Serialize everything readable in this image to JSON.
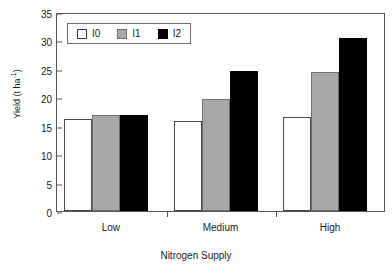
{
  "chart_data": {
    "type": "bar",
    "title": "",
    "xlabel": "Nitrogen Supply",
    "ylabel": "Yield (t ha",
    "ylabel_sup": "-1",
    "ylabel_close": ")",
    "categories": [
      "Low",
      "Medium",
      "High"
    ],
    "series": [
      {
        "name": "I0",
        "color": "#ffffff",
        "values": [
          16.1,
          15.9,
          16.6
        ]
      },
      {
        "name": "I1",
        "color": "#a8a8a8",
        "values": [
          16.9,
          19.7,
          24.5
        ]
      },
      {
        "name": "I2",
        "color": "#000000",
        "values": [
          16.8,
          24.6,
          30.5
        ]
      }
    ],
    "ylim": [
      0,
      35
    ],
    "yticks": [
      0,
      5,
      10,
      15,
      20,
      25,
      30,
      35
    ],
    "ytick_labels": [
      "0",
      "5",
      "10",
      "15",
      "20",
      "25",
      "30",
      "35"
    ],
    "grid": false,
    "legend_position": "top-left"
  },
  "legend": {
    "entries": [
      {
        "label": "I0",
        "swatch": "white-square-swatch"
      },
      {
        "label": "I1",
        "swatch": "gray-square-swatch"
      },
      {
        "label": "I2",
        "swatch": "black-square-swatch"
      }
    ]
  }
}
